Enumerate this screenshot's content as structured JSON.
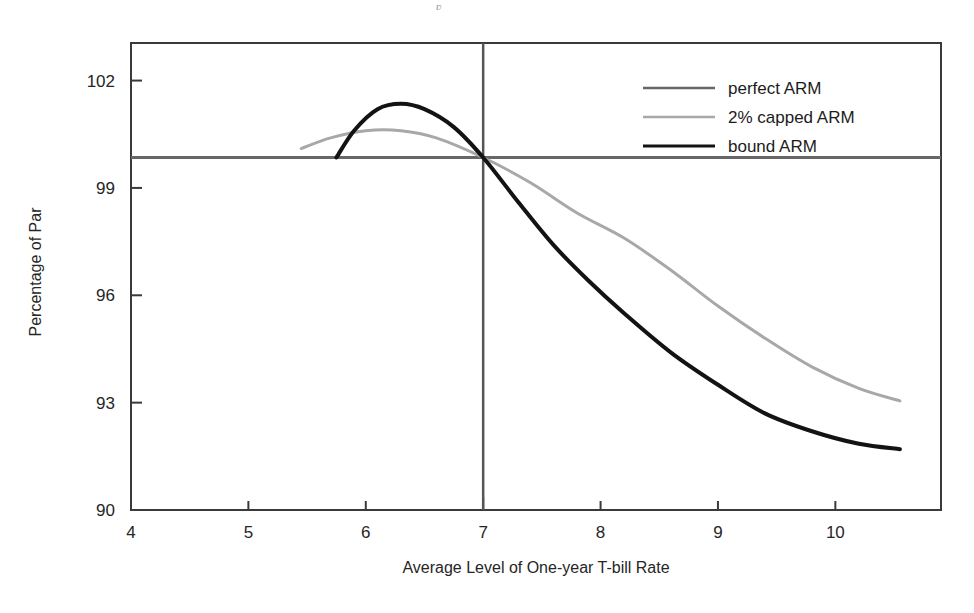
{
  "figure": {
    "background_color": "#ffffff",
    "frame_color": "#3a3a3a",
    "artifact_mark": "ʋ"
  },
  "chart_data": {
    "type": "line",
    "title": "",
    "xlabel": "Average Level of One-year T-bill Rate",
    "ylabel": "Percentage of Par",
    "xlim": [
      4,
      10.9
    ],
    "ylim": [
      90,
      103.05
    ],
    "xticks": [
      4,
      5,
      6,
      7,
      8,
      9,
      10
    ],
    "xtick_labels": [
      "4",
      "5",
      "6",
      "7",
      "8",
      "9",
      "10"
    ],
    "yticks": [
      90,
      93,
      96,
      99,
      102
    ],
    "ytick_labels": [
      "90",
      "93",
      "96",
      "99",
      "102"
    ],
    "grid": false,
    "legend_position": "top-right",
    "reference_lines": [
      {
        "name": "par-horizontal",
        "orientation": "horizontal",
        "value": 99.85,
        "color": "#676767"
      },
      {
        "name": "coupon-vertical",
        "orientation": "vertical",
        "value": 7.0,
        "color": "#555555"
      }
    ],
    "series": [
      {
        "name": "perfect ARM",
        "color": "#676767",
        "width": 3.0,
        "note": "flat at par across the full rate range",
        "x": [
          4.0,
          10.9
        ],
        "values": [
          99.85,
          99.85
        ]
      },
      {
        "name": "2% capped ARM",
        "color": "#a8a8a8",
        "width": 3.0,
        "x": [
          5.45,
          5.7,
          6.0,
          6.3,
          6.6,
          7.0,
          7.4,
          7.8,
          8.2,
          8.6,
          9.0,
          9.4,
          9.8,
          10.2,
          10.55
        ],
        "values": [
          100.1,
          100.4,
          100.6,
          100.6,
          100.4,
          99.85,
          99.15,
          98.3,
          97.6,
          96.7,
          95.7,
          94.8,
          94.0,
          93.4,
          93.05
        ]
      },
      {
        "name": "bound ARM",
        "color": "#131313",
        "width": 4.0,
        "x": [
          5.75,
          5.9,
          6.1,
          6.3,
          6.5,
          6.75,
          7.0,
          7.3,
          7.6,
          7.9,
          8.2,
          8.6,
          9.0,
          9.4,
          9.8,
          10.2,
          10.55
        ],
        "values": [
          99.85,
          100.6,
          101.2,
          101.35,
          101.2,
          100.7,
          99.85,
          98.6,
          97.4,
          96.4,
          95.5,
          94.4,
          93.5,
          92.7,
          92.2,
          91.85,
          91.7
        ]
      }
    ]
  },
  "legend": {
    "entries": [
      {
        "label": "perfect ARM",
        "color": "#676767"
      },
      {
        "label": "2% capped ARM",
        "color": "#a8a8a8"
      },
      {
        "label": "bound ARM",
        "color": "#131313"
      }
    ]
  }
}
